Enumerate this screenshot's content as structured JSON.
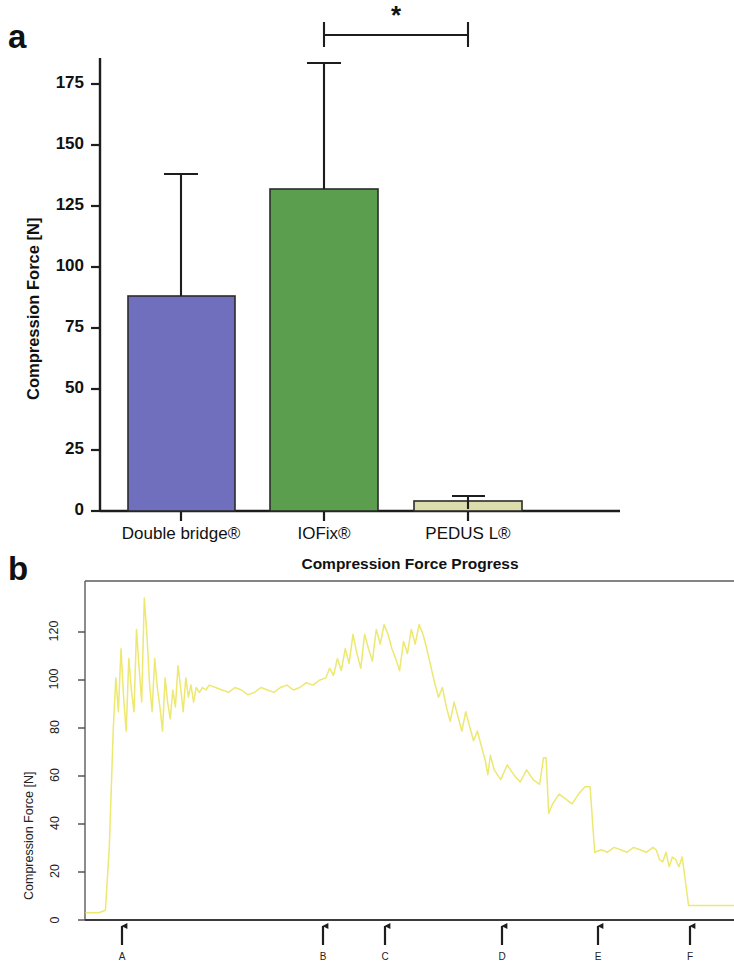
{
  "figure": {
    "panel_a_letter": "a",
    "panel_b_letter": "b"
  },
  "panel_a": {
    "ylabel": "Compression Force [N]",
    "yticks": [
      "0",
      "25",
      "50",
      "75",
      "100",
      "125",
      "150",
      "175"
    ],
    "categories": [
      "Double bridge®",
      "IOFix®",
      "PEDUS L®"
    ],
    "significance_marker": "*",
    "colors": {
      "double_bridge": "#6F6FBE",
      "iofix": "#5B9E4E",
      "pedus_l": "#DDDCAD",
      "outline": "#2b2b2b"
    }
  },
  "panel_b": {
    "title": "Compression Force Progress",
    "ylabel": "Compression Force [N]",
    "yticks": [
      "0",
      "20",
      "40",
      "60",
      "80",
      "100",
      "120"
    ],
    "arrow_labels": [
      "A",
      "B",
      "C",
      "D",
      "E",
      "F"
    ],
    "trace_color": "#EDE870"
  },
  "chart_data": [
    {
      "type": "bar",
      "panel": "a",
      "title": "",
      "xlabel": "",
      "ylabel": "Compression Force [N]",
      "categories": [
        "Double bridge®",
        "IOFix®",
        "PEDUS L®"
      ],
      "values": [
        88,
        132,
        4
      ],
      "errors_upper": [
        138,
        181,
        6
      ],
      "ylim": [
        0,
        185
      ],
      "yticks": [
        0,
        25,
        50,
        75,
        100,
        125,
        150,
        175
      ],
      "grid": false,
      "legend": "none",
      "bar_colors": [
        "#6F6FBE",
        "#5B9E4E",
        "#DDDCAD"
      ],
      "annotations": [
        {
          "text": "*",
          "between": [
            "IOFix®",
            "PEDUS L®"
          ],
          "y": 196
        }
      ]
    },
    {
      "type": "line",
      "panel": "b",
      "title": "Compression Force Progress",
      "xlabel": "",
      "ylabel": "Compression Force [N]",
      "ylim": [
        0,
        140
      ],
      "yticks": [
        0,
        20,
        40,
        60,
        80,
        100,
        120
      ],
      "xlim": [
        0,
        100
      ],
      "grid": false,
      "legend": "none",
      "line_color": "#EDE870",
      "annotations": [
        {
          "text": "A",
          "x": 6
        },
        {
          "text": "B",
          "x": 37
        },
        {
          "text": "C",
          "x": 46
        },
        {
          "text": "D",
          "x": 62
        },
        {
          "text": "E",
          "x": 77
        },
        {
          "text": "F",
          "x": 91
        }
      ],
      "x": [
        0.0,
        1.0,
        2.0,
        3.0,
        3.6,
        4.2,
        4.6,
        5.0,
        5.4,
        5.8,
        6.2,
        6.6,
        7.0,
        7.4,
        7.8,
        8.2,
        8.6,
        9.0,
        9.4,
        9.8,
        10.2,
        10.6,
        11.0,
        11.4,
        11.8,
        12.2,
        12.6,
        13.0,
        13.4,
        13.8,
        14.2,
        14.6,
        15.0,
        15.4,
        15.8,
        16.2,
        16.6,
        17.0,
        17.5,
        18.0,
        18.5,
        19.0,
        20.0,
        21.0,
        22.0,
        23.0,
        24.0,
        25.0,
        26.0,
        27.0,
        28.0,
        29.0,
        30.0,
        31.0,
        32.0,
        33.0,
        34.0,
        35.0,
        36.0,
        37.0,
        37.6,
        38.2,
        38.8,
        39.4,
        40.0,
        40.6,
        41.2,
        41.8,
        42.4,
        43.0,
        43.6,
        44.2,
        44.8,
        45.4,
        46.0,
        46.6,
        47.2,
        47.8,
        48.4,
        49.0,
        49.6,
        50.2,
        50.8,
        51.4,
        52.0,
        52.6,
        53.2,
        53.8,
        54.4,
        55.0,
        55.6,
        56.2,
        56.8,
        57.4,
        58.0,
        58.6,
        59.2,
        59.8,
        60.4,
        61.0,
        61.6,
        62.0,
        62.4,
        63.0,
        64.0,
        65.0,
        66.0,
        67.0,
        68.0,
        69.0,
        70.0,
        70.6,
        71.0,
        71.4,
        72.0,
        73.0,
        74.0,
        75.0,
        76.0,
        77.0,
        77.4,
        77.8,
        78.5,
        79.5,
        80.5,
        81.5,
        82.5,
        83.5,
        84.5,
        85.5,
        86.5,
        87.5,
        88.0,
        88.5,
        89.0,
        89.5,
        90.0,
        90.5,
        91.0,
        91.5,
        92.0,
        93.0,
        94.0,
        95.0,
        96.0,
        97.0,
        98.0,
        99.0,
        100.0
      ],
      "y": [
        3,
        3,
        3,
        4,
        30,
        78,
        100,
        86,
        112,
        92,
        78,
        108,
        95,
        86,
        120,
        104,
        90,
        133,
        118,
        98,
        86,
        108,
        96,
        88,
        78,
        100,
        90,
        83,
        95,
        88,
        105,
        96,
        86,
        100,
        92,
        97,
        90,
        96,
        94,
        96,
        95,
        97,
        96,
        95,
        94,
        96,
        95,
        93,
        94,
        96,
        95,
        94,
        96,
        97,
        95,
        96,
        98,
        97,
        99,
        100,
        104,
        101,
        108,
        103,
        112,
        106,
        118,
        110,
        104,
        118,
        112,
        107,
        120,
        114,
        122,
        118,
        112,
        108,
        103,
        115,
        110,
        120,
        114,
        122,
        118,
        112,
        105,
        98,
        92,
        96,
        88,
        82,
        90,
        84,
        78,
        86,
        80,
        74,
        78,
        72,
        66,
        60,
        68,
        62,
        58,
        64,
        60,
        57,
        62,
        58,
        56,
        67,
        67,
        44,
        48,
        52,
        50,
        48,
        52,
        55,
        55,
        55,
        28,
        29,
        28,
        30,
        29,
        28,
        30,
        29,
        28,
        30,
        29,
        25,
        24,
        28,
        22,
        26,
        25,
        22,
        26,
        6,
        6,
        6,
        6,
        6,
        6,
        6,
        6
      ]
    }
  ]
}
